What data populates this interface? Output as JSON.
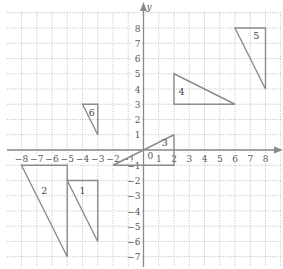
{
  "diagram": {
    "type": "coordinate-grid",
    "x_axis": {
      "min": -8,
      "max": 8,
      "label": "x"
    },
    "y_axis": {
      "min": -7,
      "max": 8,
      "label": "y"
    },
    "origin_label": "0",
    "x_ticks": [
      "-8",
      "-7",
      "-6",
      "-5",
      "-4",
      "-3",
      "-2",
      "-1",
      "1",
      "2",
      "3",
      "4",
      "5",
      "6",
      "7",
      "8"
    ],
    "y_ticks": [
      "8",
      "7",
      "6",
      "5",
      "4",
      "3",
      "2",
      "1",
      "-1",
      "-2",
      "-3",
      "-4",
      "-5",
      "-6",
      "-7"
    ],
    "colors": {
      "grid": "#b8b8b8",
      "axis": "#8a8a8a",
      "shape": "#8c8c8c",
      "text": "#555555"
    },
    "triangles": [
      {
        "id": "1",
        "label": "1",
        "vertices": [
          [
            -5,
            -2
          ],
          [
            -3,
            -2
          ],
          [
            -3,
            -6
          ]
        ],
        "label_pos": [
          -4,
          -2.9
        ]
      },
      {
        "id": "2",
        "label": "2",
        "vertices": [
          [
            -8,
            -1
          ],
          [
            -5,
            -1
          ],
          [
            -5,
            -7
          ]
        ],
        "label_pos": [
          -6.5,
          -2.9
        ]
      },
      {
        "id": "3",
        "label": "3",
        "vertices": [
          [
            -2,
            -1
          ],
          [
            2,
            1
          ],
          [
            2,
            -1
          ]
        ],
        "label_pos": [
          1.4,
          0.25
        ]
      },
      {
        "id": "4",
        "label": "4",
        "vertices": [
          [
            2,
            5
          ],
          [
            2,
            3
          ],
          [
            6,
            3
          ]
        ],
        "label_pos": [
          2.5,
          3.6
        ]
      },
      {
        "id": "5",
        "label": "5",
        "vertices": [
          [
            6,
            8
          ],
          [
            8,
            8
          ],
          [
            8,
            4
          ]
        ],
        "label_pos": [
          7.4,
          7.25
        ]
      },
      {
        "id": "6",
        "label": "6",
        "vertices": [
          [
            -4,
            3
          ],
          [
            -3,
            3
          ],
          [
            -3,
            1
          ]
        ],
        "label_pos": [
          -3.4,
          2.25
        ]
      }
    ]
  }
}
